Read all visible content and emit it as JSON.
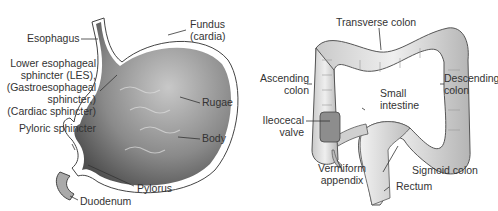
{
  "stomach": {
    "labels": {
      "esophagus": "Esophagus",
      "fundus_1": "Fundus",
      "fundus_2": "(cardia)",
      "les_1": "Lower esophageal",
      "les_2": "sphincter (LES),",
      "les_3": "(Gastroesophageal",
      "les_4": "sphincter,)",
      "les_5": "(Cardiac sphincter)",
      "rugae": "Rugae",
      "body": "Body",
      "pyloric_sphincter": "Pyloric sphincter",
      "pylorus": "Pylorus",
      "duodenum": "Duodenum"
    }
  },
  "colon": {
    "labels": {
      "transverse": "Transverse colon",
      "ascending_1": "Ascending",
      "ascending_2": "colon",
      "descending_1": "Descending",
      "descending_2": "colon",
      "small_1": "Small",
      "small_2": "intestine",
      "ileocecal_1": "Ileocecal",
      "ileocecal_2": "valve",
      "appendix_1": "Vermiform",
      "appendix_2": "appendix",
      "sigmoid": "Sigmoid colon",
      "rectum": "Rectum"
    }
  },
  "colors": {
    "tissue_dark": "#6e6e6e",
    "tissue_light": "#d8d8d8",
    "text": "#333333"
  }
}
